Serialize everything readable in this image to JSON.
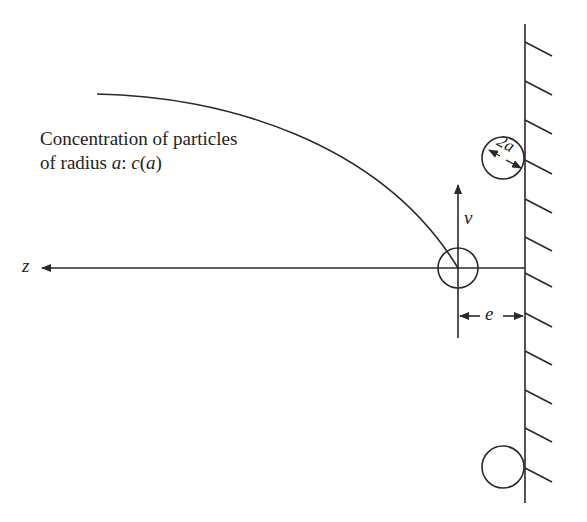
{
  "diagram": {
    "caption": {
      "line1": "Concentration of particles",
      "line2_prefix": "of radius ",
      "line2_var": "a",
      "line2_colon": ": ",
      "line2_func": "c",
      "line2_paren_open": "(",
      "line2_arg": "a",
      "line2_paren_close": ")"
    },
    "labels": {
      "axis": "z",
      "velocity": "v",
      "gap": "e",
      "diameter": "2a"
    },
    "colors": {
      "stroke": "#2a2a2a",
      "background": "#ffffff"
    }
  }
}
